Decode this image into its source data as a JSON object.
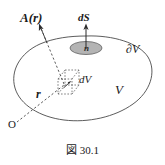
{
  "figure": {
    "caption": "図 30.1",
    "labels": {
      "vector_field": "A(r)",
      "surface_element": "dS",
      "normal": "n",
      "volume_element": "dV",
      "position_vector": "r",
      "boundary": "∂V",
      "volume": "V",
      "origin": "O"
    },
    "colors": {
      "ink": "#1a1a1a",
      "stroke": "#4a4a4a",
      "patch_fill": "#b4b4b4",
      "patch_stroke": "#6b6b6b",
      "background": "#ffffff"
    },
    "elements": {
      "region_name": "closed-volume-blob",
      "patch_name": "shaded-surface-patch",
      "cell_name": "dashed-volume-cell"
    }
  }
}
